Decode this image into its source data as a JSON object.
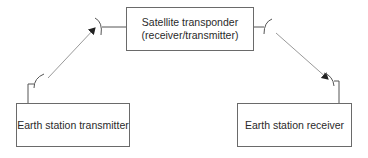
{
  "diagram": {
    "satellite": {
      "line1": "Satellite transponder",
      "line2": "(receiver/transmitter)"
    },
    "earth_transmitter": {
      "label": "Earth station transmitter"
    },
    "earth_receiver": {
      "label": "Earth station receiver"
    },
    "colors": {
      "box_border": "#6a6a6a",
      "uplink_line": "#9a9a9a",
      "antenna": "#555555",
      "text": "#2a2a2a"
    }
  }
}
